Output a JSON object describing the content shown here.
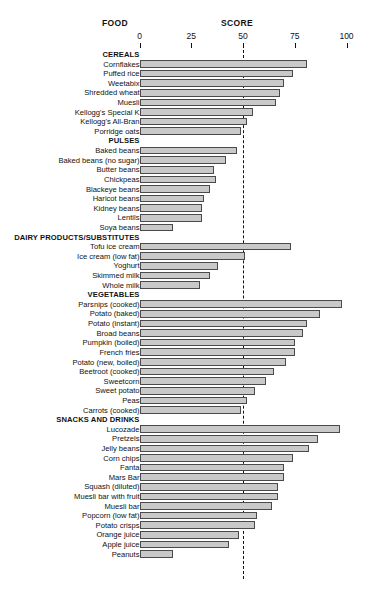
{
  "header": {
    "food_label": "FOOD",
    "score_label": "SCORE"
  },
  "chart_data": {
    "type": "bar",
    "orientation": "horizontal",
    "title": "",
    "xlabel": "SCORE",
    "ylabel": "FOOD",
    "xlim": [
      0,
      100
    ],
    "xticks": [
      0,
      25,
      50,
      75,
      100
    ],
    "xtick_labels": [
      "0",
      "25",
      "50",
      "75",
      "100"
    ],
    "grid": false,
    "legend": null,
    "reference_line": 50,
    "groups": [
      {
        "name": "CEREALS",
        "items": [
          {
            "label": "Cornflakes",
            "value": 81
          },
          {
            "label": "Puffed rice",
            "value": 74
          },
          {
            "label": "Weetabix",
            "value": 70
          },
          {
            "label": "Shredded wheat",
            "value": 68
          },
          {
            "label": "Muesli",
            "value": 66
          },
          {
            "label": "Kellogg's Special K",
            "value": 55
          },
          {
            "label": "Kellogg's All-Bran",
            "value": 52
          },
          {
            "label": "Porridge oats",
            "value": 49
          }
        ]
      },
      {
        "name": "PULSES",
        "items": [
          {
            "label": "Baked beans",
            "value": 47
          },
          {
            "label": "Baked beans (no sugar)",
            "value": 42
          },
          {
            "label": "Butter beans",
            "value": 36
          },
          {
            "label": "Chickpeas",
            "value": 37
          },
          {
            "label": "Blackeye beans",
            "value": 34
          },
          {
            "label": "Haricot beans",
            "value": 31
          },
          {
            "label": "Kidney beans",
            "value": 30
          },
          {
            "label": "Lentils",
            "value": 30
          },
          {
            "label": "Soya beans",
            "value": 16
          }
        ]
      },
      {
        "name": "DAIRY PRODUCTS/SUBSTITUTES",
        "items": [
          {
            "label": "Tofu ice cream",
            "value": 73
          },
          {
            "label": "Ice cream (low fat)",
            "value": 51
          },
          {
            "label": "Yoghurt",
            "value": 38
          },
          {
            "label": "Skimmed milk",
            "value": 34
          },
          {
            "label": "Whole milk",
            "value": 29
          }
        ]
      },
      {
        "name": "VEGETABLES",
        "items": [
          {
            "label": "Parsnips (cooked)",
            "value": 98
          },
          {
            "label": "Potato (baked)",
            "value": 87
          },
          {
            "label": "Potato (instant)",
            "value": 81
          },
          {
            "label": "Broad beans",
            "value": 79
          },
          {
            "label": "Pumpkin (boiled)",
            "value": 75
          },
          {
            "label": "French fries",
            "value": 75
          },
          {
            "label": "Potato (new, boiled)",
            "value": 71
          },
          {
            "label": "Beetroot (cooked)",
            "value": 65
          },
          {
            "label": "Sweetcorn",
            "value": 61
          },
          {
            "label": "Sweet potato",
            "value": 56
          },
          {
            "label": "Peas",
            "value": 52
          },
          {
            "label": "Carrots (cooked)",
            "value": 49
          }
        ]
      },
      {
        "name": "SNACKS AND DRINKS",
        "items": [
          {
            "label": "Lucozade",
            "value": 97
          },
          {
            "label": "Pretzels",
            "value": 86
          },
          {
            "label": "Jelly beans",
            "value": 82
          },
          {
            "label": "Corn chips",
            "value": 74
          },
          {
            "label": "Fanta",
            "value": 70
          },
          {
            "label": "Mars Bar",
            "value": 70
          },
          {
            "label": "Squash (diluted)",
            "value": 67
          },
          {
            "label": "Muesli bar with fruit",
            "value": 67
          },
          {
            "label": "Muesli bar",
            "value": 64
          },
          {
            "label": "Popcorn (low fat)",
            "value": 57
          },
          {
            "label": "Potato crisps",
            "value": 56
          },
          {
            "label": "Orange juice",
            "value": 48
          },
          {
            "label": "Apple juice",
            "value": 43
          },
          {
            "label": "Peanuts",
            "value": 16
          }
        ]
      }
    ],
    "style": {
      "bar_fill": "#c9c9c9",
      "bar_stroke": "#4a4a4a",
      "text_color": "#111111",
      "background": "#ffffff"
    }
  }
}
